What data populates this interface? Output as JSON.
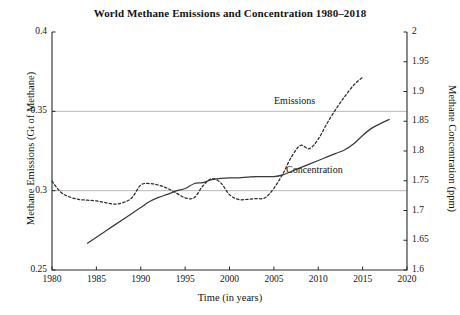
{
  "chart_data": {
    "type": "line",
    "title": "World Methane Emissions and Concentration 1980–2018",
    "xlabel": "Time (in years)",
    "ylabel_left": "Methane Emissions (Gt of Methane)",
    "ylabel_right": "Methane Concentration (ppm)",
    "xlim": [
      1980,
      2020
    ],
    "ylim_left": [
      0.25,
      0.4
    ],
    "ylim_right": [
      1.6,
      2.0
    ],
    "xticks": [
      1980,
      1985,
      1990,
      1995,
      2000,
      2005,
      2010,
      2015,
      2020
    ],
    "xticklabels": [
      "1980",
      "1985",
      "1990",
      "1995",
      "2000",
      "2005",
      "2010",
      "2015",
      "2020"
    ],
    "yticks_left": [
      0.25,
      0.3,
      0.35,
      0.4
    ],
    "yticklabels_left": [
      "0.25",
      "0.3",
      "0.35",
      "0.4"
    ],
    "yticks_right": [
      1.6,
      1.65,
      1.7,
      1.75,
      1.8,
      1.85,
      1.9,
      1.95,
      2.0
    ],
    "yticklabels_right": [
      "1.6",
      "1.65",
      "1.7",
      "1.75",
      "1.8",
      "1.85",
      "1.9",
      "1.95",
      "2"
    ],
    "grid": true,
    "gridlines_y_left": [
      0.3,
      0.35
    ],
    "legend_position": "inline-annotations",
    "series": [
      {
        "name": "Emissions",
        "axis": "left",
        "style": "dashed",
        "color": "#2b2b2b",
        "annotation": "Emissions",
        "x": [
          1980,
          1981,
          1982,
          1983,
          1984,
          1985,
          1986,
          1987,
          1988,
          1989,
          1990,
          1991,
          1992,
          1993,
          1994,
          1995,
          1996,
          1997,
          1998,
          1999,
          2000,
          2001,
          2002,
          2003,
          2004,
          2005,
          2006,
          2007,
          2008,
          2009,
          2010,
          2011,
          2012,
          2013,
          2014,
          2015
        ],
        "values": [
          0.306,
          0.299,
          0.296,
          0.2945,
          0.294,
          0.2935,
          0.2925,
          0.2915,
          0.2925,
          0.2955,
          0.3035,
          0.3045,
          0.3035,
          0.3015,
          0.2985,
          0.2955,
          0.2955,
          0.303,
          0.3075,
          0.305,
          0.2975,
          0.2945,
          0.2945,
          0.295,
          0.2955,
          0.3015,
          0.3105,
          0.3215,
          0.3285,
          0.3265,
          0.3325,
          0.3425,
          0.3515,
          0.3595,
          0.3665,
          0.3715
        ]
      },
      {
        "name": "Concentration",
        "axis": "right",
        "style": "solid",
        "color": "#3a3a3a",
        "annotation": "Concentration",
        "x": [
          1984,
          1985,
          1986,
          1987,
          1988,
          1989,
          1990,
          1991,
          1992,
          1993,
          1994,
          1995,
          1996,
          1997,
          1998,
          1999,
          2000,
          2001,
          2002,
          2003,
          2004,
          2005,
          2006,
          2007,
          2008,
          2009,
          2010,
          2011,
          2012,
          2013,
          2014,
          2015,
          2016,
          2017,
          2018
        ],
        "values": [
          1.645,
          1.655,
          1.665,
          1.675,
          1.685,
          1.695,
          1.705,
          1.715,
          1.722,
          1.727,
          1.733,
          1.737,
          1.745,
          1.747,
          1.752,
          1.754,
          1.755,
          1.755,
          1.756,
          1.757,
          1.757,
          1.757,
          1.76,
          1.766,
          1.772,
          1.778,
          1.784,
          1.79,
          1.796,
          1.802,
          1.812,
          1.826,
          1.838,
          1.846,
          1.853
        ]
      }
    ]
  },
  "annotations": {
    "emissions_label": "Emissions",
    "concentration_label": "Concentration"
  },
  "colors": {
    "axis": "#2a2a2a",
    "grid": "#9a9a9a",
    "emissions": "#2b2b2b",
    "concentration": "#3a3a3a",
    "background": "#ffffff"
  }
}
